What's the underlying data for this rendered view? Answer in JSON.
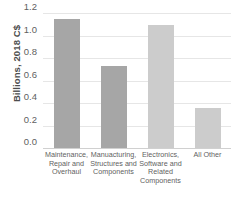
{
  "chart_data": {
    "type": "bar",
    "title": "",
    "xlabel": "",
    "ylabel": "Billions, 2018 C$",
    "ylim": [
      0.0,
      1.2
    ],
    "ytick_labels": [
      "1.2",
      "1.0",
      "0.8",
      "0.6",
      "0.4",
      "0.2",
      "0.0"
    ],
    "ytick_values": [
      1.2,
      1.0,
      0.8,
      0.6,
      0.4,
      0.2,
      0.0
    ],
    "grid": true,
    "legend": false,
    "categories": [
      "Maintenance, Repair and Overhaul",
      "Manuacturing, Structures and Components",
      "Electronics, Software and Related Components",
      "All Other"
    ],
    "category_lines": [
      [
        "Maintenance,",
        "Repair and",
        "Overhaul"
      ],
      [
        "Manuacturing,",
        "Structures and",
        "Components"
      ],
      [
        "Electronics,",
        "Software and",
        "Related",
        "Components"
      ],
      [
        "All Other"
      ]
    ],
    "values": [
      1.15,
      0.73,
      1.09,
      0.36
    ],
    "bar_colors": [
      "#a6a6a6",
      "#a6a6a6",
      "#cccccc",
      "#cccccc"
    ]
  },
  "colors": {
    "bar_dark": "#a6a6a6",
    "bar_light": "#cccccc",
    "gridline": "#e6e6e6",
    "axis": "#d0d0d0",
    "text": "#5f5f5f"
  }
}
